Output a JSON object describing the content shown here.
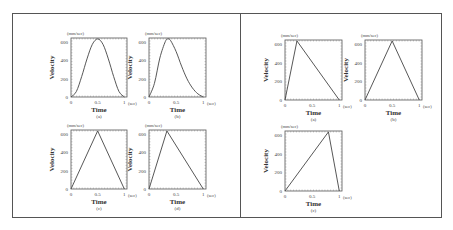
{
  "panels": {
    "left": {
      "charts": [
        {
          "id": "a",
          "caption": "(a)",
          "y_unit": "(mm/sec)",
          "ylabel": "Velocity",
          "xlabel": "Time",
          "x_unit": "(sec)",
          "yticks": [
            "0",
            "200",
            "400",
            "600"
          ],
          "xticks": [
            "0",
            "0.5",
            "1"
          ]
        },
        {
          "id": "b",
          "caption": "(b)",
          "y_unit": "(mm/sec)",
          "ylabel": "Velocity",
          "xlabel": "Time",
          "x_unit": "(sec)",
          "yticks": [
            "0",
            "200",
            "400",
            "600"
          ],
          "xticks": [
            "0",
            "0.5",
            "1"
          ]
        },
        {
          "id": "c",
          "caption": "(c)",
          "y_unit": "(mm/sec)",
          "ylabel": "Velocity",
          "xlabel": "Time",
          "x_unit": "(sec)",
          "yticks": [
            "0",
            "200",
            "400",
            "600"
          ],
          "xticks": [
            "0",
            "0.5",
            "1"
          ]
        },
        {
          "id": "d",
          "caption": "(d)",
          "y_unit": "(mm/sec)",
          "ylabel": "Velocity",
          "xlabel": "Time",
          "x_unit": "(sec)",
          "yticks": [
            "0",
            "200",
            "400",
            "600"
          ],
          "xticks": [
            "0",
            "0.5",
            "1"
          ]
        }
      ]
    },
    "right": {
      "charts": [
        {
          "id": "a",
          "caption": "(a)",
          "y_unit": "(mm/sec)",
          "ylabel": "Velocity",
          "xlabel": "Time",
          "x_unit": "(sec)",
          "yticks": [
            "0",
            "200",
            "400",
            "600"
          ],
          "xticks": [
            "0",
            "0.5",
            "1"
          ]
        },
        {
          "id": "b",
          "caption": "(b)",
          "y_unit": "(mm/sec)",
          "ylabel": "Velocity",
          "xlabel": "Time",
          "x_unit": "(sec)",
          "yticks": [
            "0",
            "200",
            "400",
            "600"
          ],
          "xticks": [
            "0",
            "0.5",
            "1"
          ]
        },
        {
          "id": "c",
          "caption": "(c)",
          "y_unit": "(mm/sec)",
          "ylabel": "Velocity",
          "xlabel": "Time",
          "x_unit": "(sec)",
          "yticks": [
            "0",
            "200",
            "400",
            "600"
          ],
          "xticks": [
            "0",
            "0.5",
            "1"
          ]
        }
      ]
    }
  },
  "chart_data": [
    {
      "type": "line",
      "panel": "left",
      "caption": "(a)",
      "xlabel": "Time (sec)",
      "ylabel": "Velocity (mm/sec)",
      "xlim": [
        0,
        1.05
      ],
      "ylim": [
        0,
        650
      ],
      "x": [
        0,
        0.1,
        0.2,
        0.3,
        0.4,
        0.5,
        0.6,
        0.7,
        0.8,
        0.9,
        1.0
      ],
      "y": [
        0,
        60,
        225,
        420,
        580,
        640,
        580,
        420,
        225,
        60,
        0
      ],
      "shape": "symmetric bell"
    },
    {
      "type": "line",
      "panel": "left",
      "caption": "(b)",
      "xlabel": "Time (sec)",
      "ylabel": "Velocity (mm/sec)",
      "xlim": [
        0,
        1.05
      ],
      "ylim": [
        0,
        650
      ],
      "x": [
        0,
        0.1,
        0.2,
        0.3,
        0.35,
        0.4,
        0.5,
        0.6,
        0.7,
        0.8,
        0.9,
        1.0
      ],
      "y": [
        0,
        150,
        430,
        610,
        640,
        620,
        500,
        340,
        200,
        100,
        35,
        0
      ],
      "shape": "skewed bell, peak ~0.35"
    },
    {
      "type": "line",
      "panel": "left",
      "caption": "(c)",
      "xlabel": "Time (sec)",
      "ylabel": "Velocity (mm/sec)",
      "xlim": [
        0,
        1.05
      ],
      "ylim": [
        0,
        650
      ],
      "x": [
        0,
        0.5,
        1.0
      ],
      "y": [
        0,
        640,
        0
      ],
      "shape": "symmetric triangle"
    },
    {
      "type": "line",
      "panel": "left",
      "caption": "(d)",
      "xlabel": "Time (sec)",
      "ylabel": "Velocity (mm/sec)",
      "xlim": [
        0,
        1.05
      ],
      "ylim": [
        0,
        650
      ],
      "x": [
        0,
        0.33,
        1.0
      ],
      "y": [
        0,
        640,
        0
      ],
      "shape": "asymmetric triangle, peak ~0.33"
    },
    {
      "type": "line",
      "panel": "right",
      "caption": "(a)",
      "xlabel": "Time (sec)",
      "ylabel": "Velocity (mm/sec)",
      "xlim": [
        0,
        1.05
      ],
      "ylim": [
        0,
        650
      ],
      "x": [
        0,
        0.22,
        1.0
      ],
      "y": [
        0,
        640,
        0
      ],
      "shape": "asymmetric triangle, peak ~0.22"
    },
    {
      "type": "line",
      "panel": "right",
      "caption": "(b)",
      "xlabel": "Time (sec)",
      "ylabel": "Velocity (mm/sec)",
      "xlim": [
        0,
        1.05
      ],
      "ylim": [
        0,
        650
      ],
      "x": [
        0,
        0.5,
        1.0
      ],
      "y": [
        0,
        640,
        0
      ],
      "shape": "symmetric triangle"
    },
    {
      "type": "line",
      "panel": "right",
      "caption": "(c)",
      "xlabel": "Time (sec)",
      "ylabel": "Velocity (mm/sec)",
      "xlim": [
        0,
        1.05
      ],
      "ylim": [
        0,
        650
      ],
      "x": [
        0,
        0.8,
        1.0
      ],
      "y": [
        0,
        640,
        0
      ],
      "shape": "asymmetric triangle, peak ~0.8"
    }
  ]
}
